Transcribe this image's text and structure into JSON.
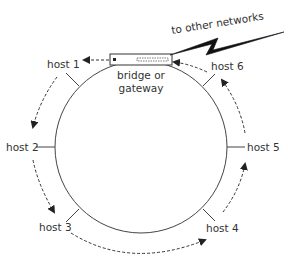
{
  "diagram": {
    "type": "ring-network",
    "colors": {
      "line": "#444444",
      "text": "#333333",
      "background": "#ffffff"
    },
    "ring": {
      "cx": 141,
      "cy": 147,
      "r": 86
    },
    "gateway": {
      "label_line1": "bridge or",
      "label_line2": "gateway"
    },
    "external": {
      "label": "to other networks"
    },
    "hosts": [
      {
        "id": "host1",
        "label": "host 1"
      },
      {
        "id": "host2",
        "label": "host 2"
      },
      {
        "id": "host3",
        "label": "host 3"
      },
      {
        "id": "host4",
        "label": "host 4"
      },
      {
        "id": "host5",
        "label": "host 5"
      },
      {
        "id": "host6",
        "label": "host 6"
      }
    ],
    "flow_direction": "counter-clockwise (gateway → host 1 → host 2 → host 3 → host 4 → host 5 → host 6 → gateway)"
  }
}
